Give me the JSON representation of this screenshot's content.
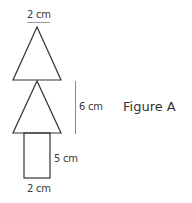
{
  "figure": {
    "title": "Figure A",
    "labels": {
      "top_width": "2 cm",
      "triangles_height": "6 cm",
      "rect_height": "5 cm",
      "rect_width": "2 cm"
    },
    "colors": {
      "stroke": "#333333",
      "dimension_line": "#8a8a8a",
      "text": "#3a3a3a"
    }
  },
  "shapes": [
    {
      "type": "triangle",
      "name": "top-triangle"
    },
    {
      "type": "triangle",
      "name": "middle-triangle"
    },
    {
      "type": "rectangle",
      "name": "trunk-rectangle"
    }
  ]
}
